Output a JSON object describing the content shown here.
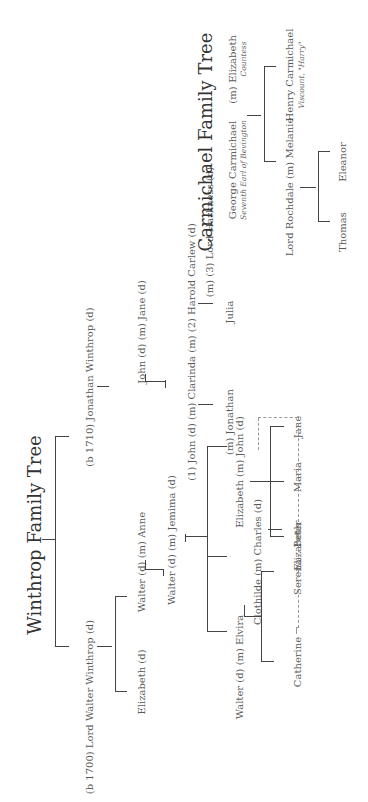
{
  "winthrop": {
    "title": "Winthrop Family Tree",
    "gen1": {
      "walter_sr": "(b 1700) Lord Walter Winthrop (d)",
      "jonathan_sr": "(b 1710) Jonathan Winthrop (d)"
    },
    "gen2": {
      "elizabeth": "Elizabeth (d)",
      "walter_anne": "Walter (d) (m) Anne",
      "john_jane": "John (d) (m) Jane (d)"
    },
    "gen3": {
      "walter_jemima": "Walter (d) (m) Jemima (d)",
      "john_clarinda": "(1) John (d) (m) Clarinda (m) (2) Harold Carlew (d)",
      "harkness": "(m) (3) Lord Harkness (d)"
    },
    "gen4": {
      "walter_elvira": "Walter (d) (m) Elvira",
      "clothilde_charles": "Clothilde (m) Charles (d)",
      "elizabeth_john": "Elizabeth (m) John (d)",
      "jonathan": "(m) Jonathan",
      "julia": "Julia"
    },
    "gen5": {
      "catherine": "Catherine",
      "serena": "Serena",
      "peter": "Peter",
      "elizabeth": "Elizabeth",
      "maria": "Maria",
      "jane": "Jane"
    }
  },
  "carmichael": {
    "title": "Carmichael Family Tree",
    "george": "George Carmichael",
    "george_title": "Seventh Earl of Bevington",
    "marriage": "(m)",
    "elizabeth": "Elizabeth",
    "elizabeth_title": "Countess",
    "rochdale_melanie": "Lord Rochdale (m) Melanie",
    "henry": "Henry Carmichael",
    "henry_title": "Viscount, \"Harry\"",
    "thomas": "Thomas",
    "eleanor": "Eleanor"
  }
}
